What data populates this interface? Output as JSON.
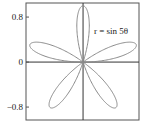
{
  "chart_data": {
    "type": "line",
    "subtype": "polar-curve",
    "equation": "r = sin 5θ",
    "annotation": "r = sin 5θ",
    "k": 5,
    "theta_range": [
      0,
      3.14159265
    ],
    "xlim": [
      -1.02,
      1.0
    ],
    "ylim": [
      -1.03,
      1.05
    ],
    "yticks": [
      {
        "value": 0.8,
        "label": "0.8"
      },
      {
        "value": 0,
        "label": "0"
      },
      {
        "value": -0.8,
        "label": "−0.8"
      }
    ],
    "xlabel": "",
    "ylabel": "",
    "title": "",
    "grid": false,
    "colors": {
      "curve": "#8a8a8a",
      "axes": "#333333",
      "frame": "#555555"
    }
  }
}
